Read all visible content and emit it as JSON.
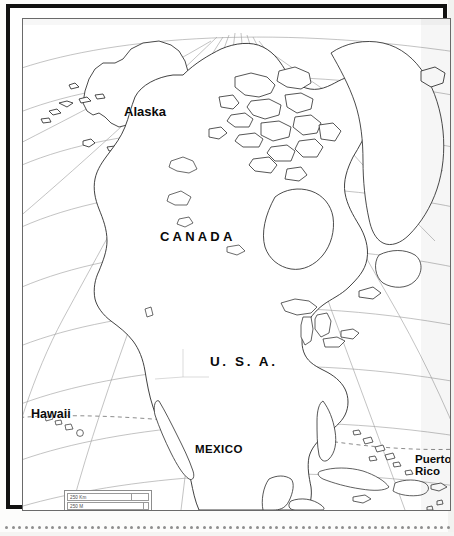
{
  "document": {
    "type": "outline map",
    "title": "North America Outline Map",
    "region": "North America"
  },
  "map": {
    "labels": [
      {
        "id": "alaska",
        "text": "Alaska",
        "style": "title-case"
      },
      {
        "id": "canada",
        "text": "CANADA",
        "style": "spaced-caps"
      },
      {
        "id": "usa",
        "text": "U. S. A.",
        "style": "spaced-caps"
      },
      {
        "id": "mexico",
        "text": "MEXICO",
        "style": "caps"
      },
      {
        "id": "hawaii",
        "text": "Hawaii",
        "style": "title-case"
      },
      {
        "id": "puerto_rico",
        "line1": "Puerto",
        "line2": "Rico",
        "style": "title-case"
      }
    ],
    "scale_bar": {
      "km_label": "250 Km",
      "mi_label": "250 M"
    },
    "features": {
      "graticule": "latitude and longitude lines, meridians converging toward the north pole",
      "tropic_line": "dashed line (Tropic of Cancer) crossing Hawaii, Mexico and the Caribbean",
      "border_style": "thick black outer frame with thin inner neatline"
    },
    "colors": {
      "frame": "#111111",
      "neatline": "#6a6a6a",
      "coastline": "#2b2b2b",
      "graticule": "#9a9a9a",
      "label_text": "#0a0a0a",
      "paper": "#ffffff",
      "dot_row": "#8e8e8e"
    }
  }
}
